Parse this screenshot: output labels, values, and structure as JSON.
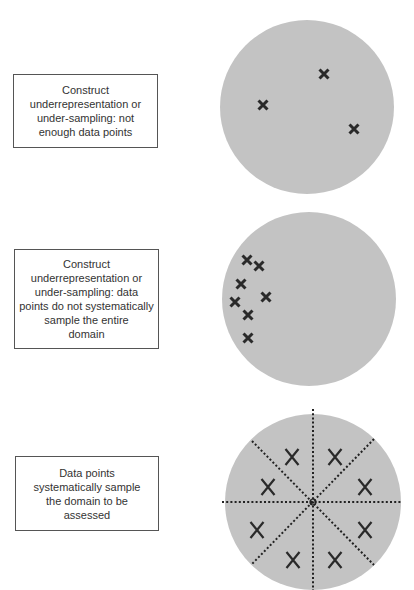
{
  "colors": {
    "circle_fill": "#c3c3c3",
    "mark": "#2a2a2a",
    "box_border": "#555555",
    "text": "#333333"
  },
  "panels": [
    {
      "id": "undersampling-few-points",
      "label": "Construct underrepresentation or under-sampling: not enough data points",
      "label_lines": [
        "Construct",
        "underrepresentation or",
        "under-sampling: not",
        "enough data points"
      ],
      "marks": "x",
      "mark_count": 3
    },
    {
      "id": "undersampling-clustered",
      "label": "Construct underrepresentation or under-sampling: data points do not systematically sample the entire domain",
      "label_lines": [
        "Construct",
        "underrepresentation or",
        "under-sampling: data",
        "points do not systematically",
        "sample the entire",
        "domain"
      ],
      "marks": "x",
      "mark_count": 7
    },
    {
      "id": "systematic-sampling",
      "label": "Data points systematically sample the domain to be assessed",
      "label_lines": [
        "Data points",
        "systematically sample",
        "the domain to be",
        "assessed"
      ],
      "marks": "X",
      "mark_count": 8,
      "sectors": 8
    }
  ]
}
